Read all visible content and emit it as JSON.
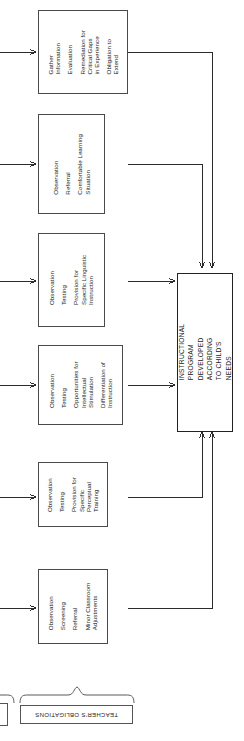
{
  "diagram": {
    "orientation": "rotated-90",
    "line_color": "#2b2b2b",
    "box_border_color": "#4a4a4a",
    "background": "#ffffff"
  },
  "stage_boxes": [
    {
      "id": "stage-gather-information",
      "lines": [
        "Gather\nInformation",
        "Evaluation",
        "Remediation for\nCritical Gaps\nin Experience",
        "Obligation to\nExtend"
      ]
    },
    {
      "id": "stage-comfortable-learning-situation",
      "lines": [
        "Observation",
        "Referral",
        "Comfortable Learning\nSituation"
      ]
    },
    {
      "id": "stage-specific-linguistic-instruction",
      "lines": [
        "Observation",
        "Testing",
        "Provision for\nSpecific Linguistic\nInstruction"
      ]
    },
    {
      "id": "stage-intellectual-stimulation",
      "lines": [
        "Observation",
        "Testing",
        "Opportunities for\nIntellectual\nStimulation",
        "Differentiation of\nInstruction"
      ]
    },
    {
      "id": "stage-perceptual-training",
      "lines": [
        "Observation",
        "Testing",
        "Provision for\nSpecific\nPerceptual\nTraining"
      ]
    },
    {
      "id": "stage-minor-classroom-adjustments",
      "lines": [
        "Observation",
        "Screening",
        "Referral",
        "Minor Classroom\nAdjustments"
      ]
    }
  ],
  "main_box": {
    "id": "instructional-program",
    "lines": [
      "INSTRUCTIONAL PROGRAM",
      "DEVELOPED ACCORDING",
      "TO CHILD'S NEEDS"
    ]
  },
  "obligations_label": {
    "text": "TEACHER'S OBLIGATIONS"
  }
}
